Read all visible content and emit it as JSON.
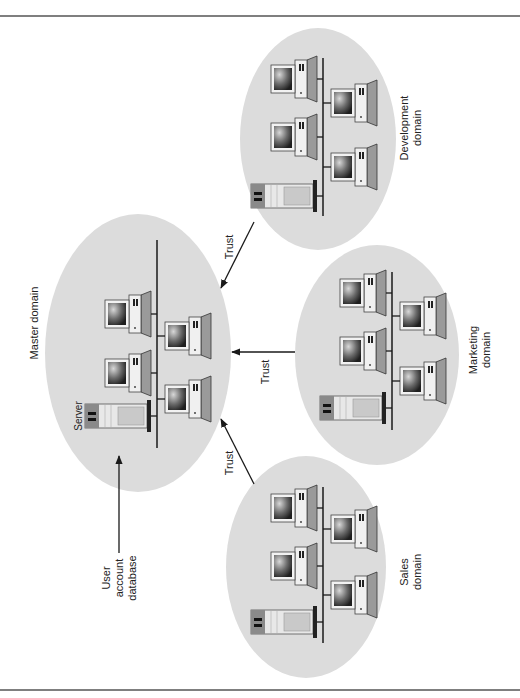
{
  "diagram": {
    "colors": {
      "domain_fill": "#dcdcdc",
      "line": "#1a1a1a",
      "border": "#555555",
      "server_body": "#e8e8e8",
      "server_panel": "#8a8a8a",
      "monitor_frame": "#f2f2f2"
    },
    "domains": [
      {
        "id": "master",
        "label": "Master domain",
        "server_label": "Server",
        "pcs": 4,
        "servers": 1
      },
      {
        "id": "development",
        "label_lines": [
          "Development",
          "domain"
        ],
        "pcs": 4,
        "servers": 1
      },
      {
        "id": "marketing",
        "label_lines": [
          "Marketing",
          "domain"
        ],
        "pcs": 4,
        "servers": 1
      },
      {
        "id": "sales",
        "label_lines": [
          "Sales",
          "domain"
        ],
        "pcs": 4,
        "servers": 1
      }
    ],
    "trust_links": [
      {
        "from": "development",
        "to": "master",
        "label": "Trust"
      },
      {
        "from": "marketing",
        "to": "master",
        "label": "Trust"
      },
      {
        "from": "sales",
        "to": "master",
        "label": "Trust"
      }
    ],
    "annotation": {
      "target": "master-server",
      "label_lines": [
        "User",
        "account",
        "database"
      ]
    }
  }
}
